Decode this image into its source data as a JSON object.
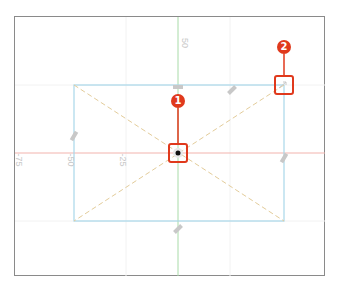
{
  "diagram": {
    "axis_labels": {
      "top": "50",
      "left_edge": "-75",
      "left_mid": "-50",
      "left_inner": "-25"
    },
    "callouts": [
      {
        "number": "1",
        "target": "center-pivot-point"
      },
      {
        "number": "2",
        "target": "top-right-corner-handle"
      }
    ],
    "colors": {
      "x_axis": "#f2b3ad",
      "y_axis": "#a8dba8",
      "rect": "#a9d8ea",
      "diagonal": "#e3cc9a",
      "callout": "#e0391c",
      "frame": "#8a8a8a"
    }
  }
}
